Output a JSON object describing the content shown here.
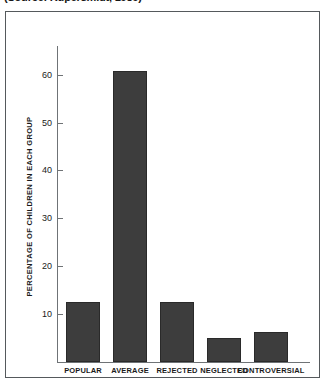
{
  "caption": {
    "source_text": "(Source: Kupersmidt, 1989)"
  },
  "chart_data": {
    "type": "bar",
    "title": "",
    "subtitle": "",
    "xlabel": "",
    "ylabel": "PERCENTAGE OF CHILDREN IN EACH GROUP",
    "categories": [
      "POPULAR",
      "AVERAGE",
      "REJECTED",
      "NEGLECTED",
      "CONTROVERSIAL"
    ],
    "values": [
      12.6,
      60.8,
      12.6,
      5.0,
      6.3
    ],
    "ylim": [
      0,
      66
    ],
    "yticks": [
      10,
      20,
      30,
      40,
      50,
      60
    ],
    "ytick_labels": [
      "10",
      "20",
      "30",
      "40",
      "50",
      "60"
    ],
    "grid": false,
    "legend": null,
    "bar_color": "#3d3d3d",
    "bar_edge_color": "#2a2a2a",
    "axis_color": "#6f7376",
    "frame_color": "#55595c",
    "background": "#ffffff"
  }
}
